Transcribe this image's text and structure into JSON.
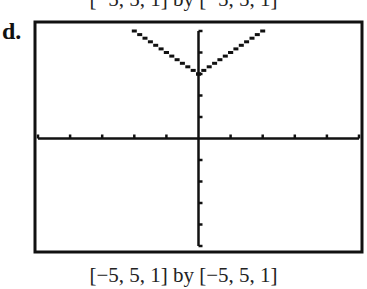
{
  "header": {
    "previous_caption": "[−5, 5, 1] by [−5, 5, 1]"
  },
  "panel": {
    "label": "d.",
    "caption": "[−5, 5, 1] by [−5, 5, 1]"
  },
  "colors": {
    "ink": "#111111",
    "background": "#ffffff"
  },
  "chart_data": {
    "type": "line",
    "title": "",
    "panel_label": "d.",
    "caption": "[−5, 5, 1] by [−5, 5, 1]",
    "function": "y = |x| + 3",
    "xlabel": "",
    "ylabel": "",
    "xlim": [
      -5,
      5
    ],
    "ylim": [
      -5,
      5
    ],
    "xscale": 1,
    "yscale": 1,
    "grid": false,
    "legend": null,
    "axes_ticks": {
      "x": [
        -5,
        -4,
        -3,
        -2,
        -1,
        1,
        2,
        3,
        4,
        5
      ],
      "y": [
        -5,
        -4,
        -3,
        -2,
        -1,
        1,
        2,
        3,
        4,
        5
      ]
    },
    "series": [
      {
        "name": "y = |x| + 3",
        "style": "dotted-pixel",
        "x": [
          -2,
          -1,
          0,
          1,
          2
        ],
        "y": [
          5,
          4,
          3,
          4,
          5
        ]
      }
    ]
  }
}
